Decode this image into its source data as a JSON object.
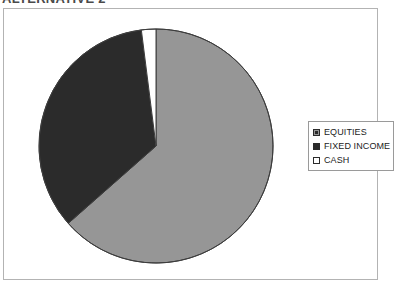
{
  "page_title": "ALTERNATIVE 2",
  "chart_data": {
    "type": "pie",
    "title": "ALTERNATIVE 2",
    "categories": [
      "EQUITIES",
      "FIXED INCOME",
      "CASH"
    ],
    "values": [
      63.5,
      34.5,
      2.0
    ],
    "value_unit": "percent",
    "colors": [
      "#969696",
      "#2b2b2b",
      "#ffffff"
    ],
    "start_angle_deg": 0,
    "direction": "clockwise",
    "legend_position": "right",
    "grid": false,
    "xlabel": "",
    "ylabel": "",
    "slices": [
      {
        "label": "EQUITIES",
        "value": 63.5,
        "color": "#969696",
        "swatch": "pattern-dotted"
      },
      {
        "label": "FIXED INCOME",
        "value": 34.5,
        "color": "#2b2b2b",
        "swatch": "solid-dark"
      },
      {
        "label": "CASH",
        "value": 2.0,
        "color": "#ffffff",
        "swatch": "empty-white"
      }
    ]
  },
  "legend": {
    "items": [
      {
        "label": "EQUITIES"
      },
      {
        "label": "FIXED INCOME"
      },
      {
        "label": "CASH"
      }
    ]
  },
  "frame": {
    "border_color": "#b3b3b3",
    "background": "#ffffff"
  }
}
